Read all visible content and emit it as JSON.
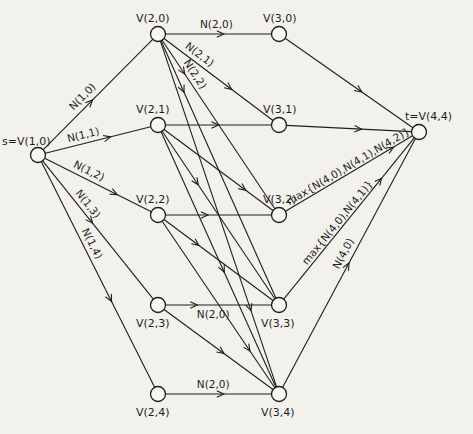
{
  "diagram": {
    "nodes": [
      {
        "id": "s",
        "label": "s=V(1,0)"
      },
      {
        "id": "v20",
        "label": "V(2,0)"
      },
      {
        "id": "v21",
        "label": "V(2,1)"
      },
      {
        "id": "v22",
        "label": "V(2,2)"
      },
      {
        "id": "v23",
        "label": "V(2,3)"
      },
      {
        "id": "v24",
        "label": "V(2,4)"
      },
      {
        "id": "v30",
        "label": "V(3,0)"
      },
      {
        "id": "v31",
        "label": "V(3,1)"
      },
      {
        "id": "v32",
        "label": "V(3,2)"
      },
      {
        "id": "v33",
        "label": "V(3,3)"
      },
      {
        "id": "v34",
        "label": "V(3,4)"
      },
      {
        "id": "t",
        "label": "t=V(4,4)"
      }
    ],
    "edges": [
      {
        "from": "s",
        "to": "v20",
        "label": "N(1,0)"
      },
      {
        "from": "s",
        "to": "v21",
        "label": "N(1,1)"
      },
      {
        "from": "s",
        "to": "v22",
        "label": "N(1,2)"
      },
      {
        "from": "s",
        "to": "v23",
        "label": "N(1,3)"
      },
      {
        "from": "s",
        "to": "v24",
        "label": "N(1,4)"
      },
      {
        "from": "v20",
        "to": "v30",
        "label": "N(2,0)"
      },
      {
        "from": "v20",
        "to": "v31",
        "label": "N(2,1)"
      },
      {
        "from": "v20",
        "to": "v32",
        "label": "N(2,2)"
      },
      {
        "from": "v20",
        "to": "v33",
        "label": ""
      },
      {
        "from": "v20",
        "to": "v34",
        "label": ""
      },
      {
        "from": "v21",
        "to": "v31",
        "label": ""
      },
      {
        "from": "v21",
        "to": "v32",
        "label": ""
      },
      {
        "from": "v21",
        "to": "v33",
        "label": ""
      },
      {
        "from": "v21",
        "to": "v34",
        "label": ""
      },
      {
        "from": "v22",
        "to": "v32",
        "label": ""
      },
      {
        "from": "v22",
        "to": "v33",
        "label": ""
      },
      {
        "from": "v22",
        "to": "v34",
        "label": ""
      },
      {
        "from": "v23",
        "to": "v33",
        "label": "N(2,0)"
      },
      {
        "from": "v23",
        "to": "v34",
        "label": ""
      },
      {
        "from": "v24",
        "to": "v34",
        "label": "N(2,0)"
      },
      {
        "from": "v30",
        "to": "t",
        "label": ""
      },
      {
        "from": "v31",
        "to": "t",
        "label": ""
      },
      {
        "from": "v32",
        "to": "t",
        "label": "max{N(4,0),N(4,1),N(4,2)}"
      },
      {
        "from": "v33",
        "to": "t",
        "label": "max{N(4,0),N(4,1)}"
      },
      {
        "from": "v34",
        "to": "t",
        "label": "N(4,0)"
      }
    ]
  }
}
